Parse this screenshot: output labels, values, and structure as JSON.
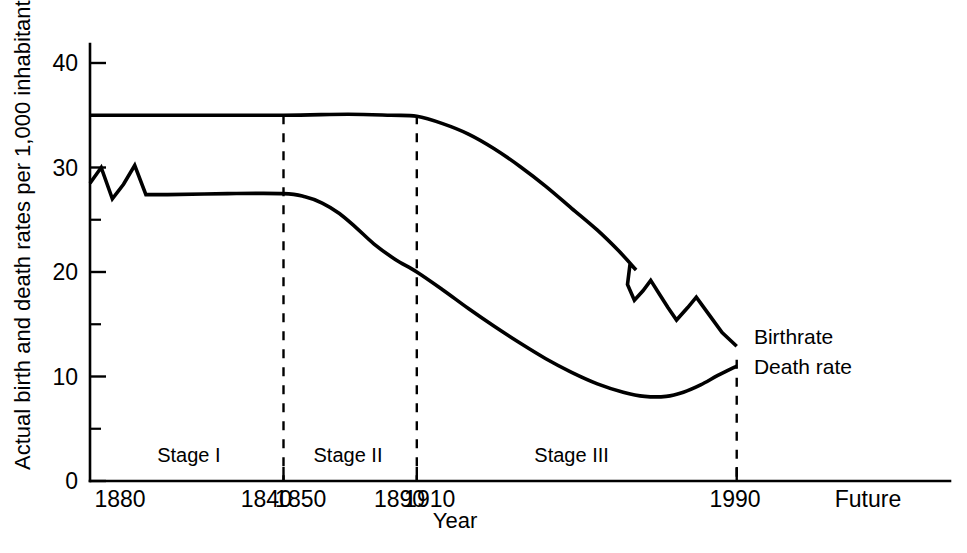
{
  "chart_data": {
    "type": "line",
    "title": "",
    "xlabel": "Year",
    "ylabel": "Actual birth and death rates per 1,000 inhabitants",
    "ylim": [
      0,
      43
    ],
    "xlim": [
      0,
      100
    ],
    "grid": false,
    "legend_position": "right-inline",
    "y_ticks_major": [
      "0",
      "10",
      "20",
      "30",
      "40"
    ],
    "y_tick_values": [
      0,
      10,
      20,
      30,
      40
    ],
    "y_ticks_minor_values": [
      5,
      15,
      25,
      35
    ],
    "x_tick_labels": [
      "1880",
      "1840",
      "1850",
      "1890",
      "1910",
      "1990",
      "Future"
    ],
    "x_tick_values": [
      0,
      20.5,
      24.5,
      36.0,
      39.5,
      75.0,
      90.0
    ],
    "stage_dividers": [
      {
        "label": "divider-1",
        "x": 22.5
      },
      {
        "label": "divider-2",
        "x": 38.0
      },
      {
        "label": "divider-3",
        "x": 75.2
      }
    ],
    "stages": [
      {
        "name": "Stage I",
        "x_center": 11.5
      },
      {
        "name": "Stage II",
        "x_center": 30.0
      },
      {
        "name": "Stage III",
        "x_center": 56.0
      }
    ],
    "series": [
      {
        "name": "Birthrate",
        "label_x": 76.5,
        "label_y": 13.8,
        "points": [
          [
            0.0,
            35.0
          ],
          [
            10.0,
            35.0
          ],
          [
            22.5,
            35.0
          ],
          [
            30.0,
            35.1
          ],
          [
            35.0,
            35.0
          ],
          [
            38.0,
            34.9
          ],
          [
            41.0,
            34.2
          ],
          [
            44.0,
            33.2
          ],
          [
            47.0,
            31.8
          ],
          [
            50.0,
            30.1
          ],
          [
            53.0,
            28.2
          ],
          [
            56.0,
            26.1
          ],
          [
            59.0,
            24.0
          ],
          [
            61.5,
            22.0
          ],
          [
            63.5,
            20.2
          ],
          [
            62.8,
            20.8
          ],
          [
            62.5,
            18.8
          ],
          [
            63.3,
            17.3
          ],
          [
            64.3,
            18.2
          ],
          [
            65.2,
            19.2
          ],
          [
            66.2,
            17.9
          ],
          [
            67.2,
            16.6
          ],
          [
            68.2,
            15.4
          ],
          [
            69.5,
            16.6
          ],
          [
            70.5,
            17.6
          ],
          [
            72.0,
            15.9
          ],
          [
            73.5,
            14.2
          ],
          [
            75.2,
            12.9
          ]
        ]
      },
      {
        "name": "Death rate",
        "label_x": 76.5,
        "label_y": 10.9,
        "points": [
          [
            0.0,
            28.5
          ],
          [
            1.3,
            30.0
          ],
          [
            2.6,
            27.0
          ],
          [
            3.9,
            28.4
          ],
          [
            5.2,
            30.2
          ],
          [
            6.5,
            27.4
          ],
          [
            9.0,
            27.4
          ],
          [
            16.0,
            27.5
          ],
          [
            22.5,
            27.5
          ],
          [
            25.0,
            27.2
          ],
          [
            27.0,
            26.6
          ],
          [
            29.0,
            25.6
          ],
          [
            31.0,
            24.2
          ],
          [
            33.0,
            22.7
          ],
          [
            35.5,
            21.2
          ],
          [
            38.0,
            20.0
          ],
          [
            41.0,
            18.3
          ],
          [
            44.0,
            16.5
          ],
          [
            47.0,
            14.8
          ],
          [
            50.0,
            13.2
          ],
          [
            53.0,
            11.7
          ],
          [
            56.0,
            10.4
          ],
          [
            59.0,
            9.3
          ],
          [
            62.0,
            8.5
          ],
          [
            64.5,
            8.1
          ],
          [
            67.0,
            8.1
          ],
          [
            69.0,
            8.5
          ],
          [
            71.0,
            9.2
          ],
          [
            73.0,
            10.1
          ],
          [
            75.2,
            11.0
          ]
        ]
      }
    ]
  },
  "axes": {
    "y_axis_title": "Actual birth and death rates per 1,000 inhabitants",
    "x_axis_title": "Year"
  }
}
